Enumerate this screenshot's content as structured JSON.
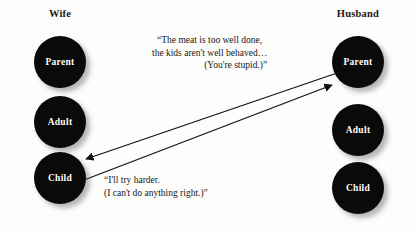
{
  "diagram": {
    "type": "transactional-analysis-crossed-transaction",
    "background_color": "#fdfdfb",
    "circle_color": "#0a0a0a",
    "label_color": "#ffffff",
    "line_color": "#101010"
  },
  "columns": [
    {
      "id": "wife",
      "header": "Wife",
      "ego_states": [
        {
          "id": "wife-parent",
          "label": "Parent"
        },
        {
          "id": "wife-adult",
          "label": "Adult"
        },
        {
          "id": "wife-child",
          "label": "Child"
        }
      ]
    },
    {
      "id": "husband",
      "header": "Husband",
      "ego_states": [
        {
          "id": "husband-parent",
          "label": "Parent"
        },
        {
          "id": "husband-adult",
          "label": "Adult"
        },
        {
          "id": "husband-child",
          "label": "Child"
        }
      ]
    }
  ],
  "quotes": {
    "parent_to_child": {
      "line1": "“The meat is too well done,",
      "line2": "the kids aren't well behaved…",
      "line3": "(You're stupid.)”"
    },
    "child_to_parent": {
      "line1": "“I'll try harder.",
      "line2": "(I can't do anything right.)”"
    }
  },
  "arrows": [
    {
      "id": "arrow-husband-parent-to-wife-child",
      "from": "husband-parent",
      "to": "wife-child",
      "direction": "right-to-left"
    },
    {
      "id": "arrow-wife-child-to-husband-parent",
      "from": "wife-child",
      "to": "husband-parent",
      "direction": "left-to-right"
    }
  ]
}
